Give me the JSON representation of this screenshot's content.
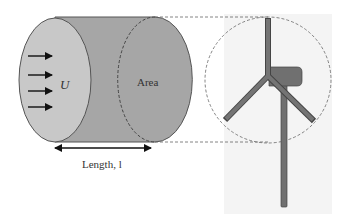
{
  "diagram": {
    "labels": {
      "velocity": "U",
      "area": "Area",
      "length": "Length, l"
    },
    "colors": {
      "cylinder_face": "#c6c6c6",
      "cylinder_body": "#a4a4a4",
      "cylinder_end": "#a0a0a0",
      "turbine": "#707070",
      "outline": "#555555",
      "dashed": "#666666",
      "background_panel": "#f3f3f3"
    },
    "flow_arrows": 4,
    "components": [
      "air-cylinder",
      "wind-arrows",
      "length-dimension",
      "rotor-swept-circle",
      "wind-turbine"
    ]
  }
}
